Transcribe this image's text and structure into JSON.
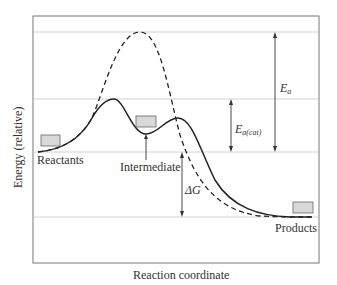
{
  "diagram": {
    "type": "reaction-energy-profile",
    "axes": {
      "xlabel": "Reaction coordinate",
      "ylabel": "Energy (relative)"
    },
    "labels": {
      "reactants": "Reactants",
      "intermediate": "Intermediate",
      "products": "Products",
      "ea": "E",
      "ea_sub": "a",
      "ea_cat": "E",
      "ea_cat_sub": "a(cat)",
      "delta_g": "ΔG"
    },
    "curves": [
      {
        "name": "uncatalyzed",
        "style": "dashed"
      },
      {
        "name": "catalyzed",
        "style": "solid"
      }
    ],
    "colors": {
      "curve": "#222222",
      "gridline": "#c8c8c8",
      "frame": "#777777",
      "box_fill": "#d9d9d9",
      "box_stroke": "#666666",
      "arrow": "#333333"
    }
  }
}
